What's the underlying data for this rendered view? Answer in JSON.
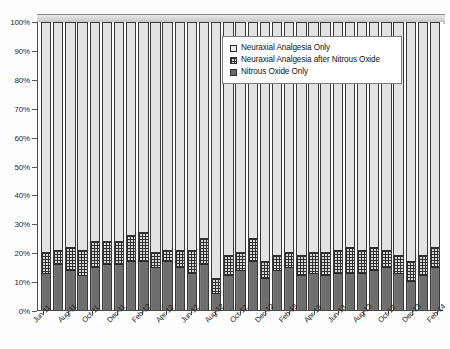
{
  "chart_data": {
    "type": "bar",
    "subtype": "100% stacked column",
    "title": "",
    "xlabel": "",
    "ylabel": "",
    "ylim": [
      0,
      100
    ],
    "ytick_labels": [
      "0%",
      "10%",
      "20%",
      "30%",
      "40%",
      "50%",
      "60%",
      "70%",
      "80%",
      "90%",
      "100%"
    ],
    "ytick_values": [
      0,
      10,
      20,
      30,
      40,
      50,
      60,
      70,
      80,
      90,
      100
    ],
    "grid": false,
    "legend_position": "top-right inside plot",
    "x": [
      "Jun-11",
      "Jul-11",
      "Aug-11",
      "Sep-11",
      "Oct-11",
      "Nov-11",
      "Dec-11",
      "Jan-12",
      "Feb-12",
      "Mar-12",
      "Apr-12",
      "May-12",
      "Jun-12",
      "Jul-12",
      "Aug-12",
      "Sep-12",
      "Oct-12",
      "Nov-12",
      "Dec-12",
      "Jan-13",
      "Feb-13",
      "Mar-13",
      "Apr-13",
      "May-13",
      "Jun-13",
      "Jul-13",
      "Aug-13",
      "Sep-13",
      "Oct-13",
      "Nov-13",
      "Dec-13",
      "Jan-14",
      "Feb-14"
    ],
    "xtick_labels": [
      "Jun-11",
      "Aug-11",
      "Oct-11",
      "Dec-11",
      "Feb-12",
      "Apr-12",
      "Jun-12",
      "Aug-12",
      "Oct-12",
      "Dec-12",
      "Feb-13",
      "Apr-13",
      "Jun-13",
      "Aug-13",
      "Oct-13",
      "Dec-13",
      "Feb-14"
    ],
    "series": [
      {
        "name": "Nitrous Oxide Only",
        "pattern": "solid-dark-gray",
        "color": "#6e6e6e",
        "values": [
          13,
          16,
          14,
          12,
          15,
          16,
          16,
          17,
          17,
          15,
          17,
          15,
          13,
          16,
          6,
          12,
          14,
          17,
          11,
          14,
          15,
          12,
          13,
          12,
          13,
          13,
          13,
          14,
          15,
          13,
          10,
          12,
          15
        ]
      },
      {
        "name": "Neuraxial Analgesia after Nitrous Oxide",
        "pattern": "checkered-grid",
        "color": "#d8d8d8",
        "values": [
          7,
          5,
          8,
          9,
          9,
          8,
          8,
          9,
          10,
          5,
          4,
          6,
          8,
          9,
          5,
          7,
          6,
          8,
          6,
          5,
          5,
          7,
          7,
          8,
          8,
          9,
          8,
          8,
          6,
          6,
          7,
          7,
          7
        ]
      },
      {
        "name": "Neuraxial Analgesia Only",
        "pattern": "light-dotted",
        "color": "#e3e3e3",
        "values": [
          80,
          79,
          78,
          79,
          76,
          76,
          76,
          74,
          73,
          80,
          79,
          79,
          79,
          75,
          89,
          81,
          80,
          75,
          83,
          81,
          80,
          81,
          80,
          80,
          79,
          78,
          79,
          78,
          79,
          81,
          83,
          81,
          78
        ]
      }
    ]
  },
  "legend": {
    "items": [
      {
        "label": "Neuraxial Analgesia Only",
        "key": "key-na"
      },
      {
        "label": "Neuraxial Analgesia after Nitrous Oxide",
        "key": "key-naNO"
      },
      {
        "label": "Nitrous Oxide Only",
        "key": "key-no"
      }
    ]
  }
}
